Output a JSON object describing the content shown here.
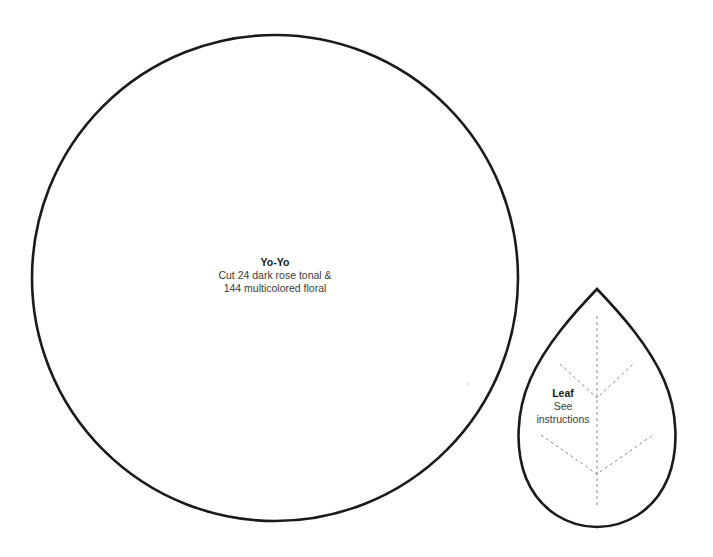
{
  "page": {
    "background": "#ffffff",
    "stroke_color": "#1a1a1a",
    "dash_color": "#8a8a8a"
  },
  "yoyo": {
    "shape": "circle",
    "title": "Yo-Yo",
    "line1": "Cut 24 dark rose tonal &",
    "line2": "144 multicolored floral",
    "center": [
      275,
      278
    ],
    "radius": 243
  },
  "leaf": {
    "shape": "teardrop",
    "title": "Leaf",
    "line1": "See",
    "line2": "instructions",
    "tip": [
      597,
      289
    ],
    "bottom_y": 527,
    "left_x": 517,
    "right_x": 677,
    "veins": {
      "midrib": {
        "x": 597,
        "y1": 316,
        "y2": 507
      },
      "upper_branch": {
        "left": [
          560,
          364
        ],
        "right": [
          633,
          364
        ],
        "join": [
          597,
          398
        ]
      },
      "lower_branch": {
        "left": [
          541,
          435
        ],
        "right": [
          653,
          435
        ],
        "join": [
          597,
          474
        ]
      }
    }
  }
}
